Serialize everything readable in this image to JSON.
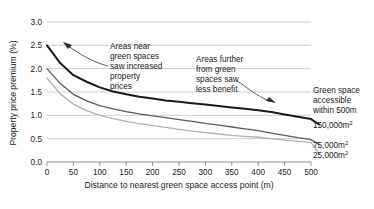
{
  "chart_data": {
    "type": "line",
    "title": "",
    "xlabel": "Distance to nearest green space access point (m)",
    "ylabel": "Property price premium (%)",
    "xlim": [
      0,
      500
    ],
    "ylim": [
      0.0,
      3.0
    ],
    "grid": true,
    "legend_position": "right",
    "x": [
      0,
      25,
      50,
      75,
      100,
      125,
      150,
      175,
      200,
      225,
      250,
      275,
      300,
      325,
      350,
      375,
      400,
      425,
      450,
      475,
      500
    ],
    "xticks": [
      "0",
      "50",
      "100",
      "150",
      "200",
      "250",
      "300",
      "350",
      "400",
      "450",
      "500"
    ],
    "xtick_values": [
      0,
      50,
      100,
      150,
      200,
      250,
      300,
      350,
      400,
      450,
      500
    ],
    "yticks": [
      "0.0",
      "0.5",
      "1.0",
      "1.5",
      "2.0",
      "2.5",
      "3.0"
    ],
    "ytick_values": [
      0.0,
      0.5,
      1.0,
      1.5,
      2.0,
      2.5,
      3.0
    ],
    "series": [
      {
        "name": "150,000m²",
        "color": "#1a1a1a",
        "width": 2.0,
        "values": [
          2.5,
          2.12,
          1.86,
          1.72,
          1.6,
          1.51,
          1.45,
          1.4,
          1.36,
          1.32,
          1.29,
          1.26,
          1.23,
          1.2,
          1.17,
          1.14,
          1.11,
          1.07,
          1.02,
          0.97,
          0.92
        ]
      },
      {
        "name": "75,000m²",
        "color": "#5b5b5b",
        "width": 1.3,
        "values": [
          2.0,
          1.68,
          1.45,
          1.31,
          1.21,
          1.14,
          1.08,
          1.03,
          0.99,
          0.95,
          0.91,
          0.87,
          0.83,
          0.79,
          0.75,
          0.71,
          0.67,
          0.62,
          0.57,
          0.52,
          0.48
        ]
      },
      {
        "name": "25,000m²",
        "color": "#b0b0b0",
        "width": 1.3,
        "values": [
          1.8,
          1.46,
          1.24,
          1.1,
          1.0,
          0.93,
          0.87,
          0.82,
          0.78,
          0.74,
          0.7,
          0.66,
          0.63,
          0.6,
          0.57,
          0.55,
          0.53,
          0.5,
          0.47,
          0.44,
          0.42
        ]
      }
    ],
    "annotations": [
      {
        "id": "near",
        "lines": [
          "Areas near",
          "green spaces",
          "saw increased",
          "property",
          "prices"
        ],
        "text": "Areas near green spaces saw increased property prices"
      },
      {
        "id": "further",
        "lines": [
          "Areas further",
          "from green",
          "spaces saw",
          "less benefit"
        ],
        "text": "Areas further from green spaces saw less benefit"
      }
    ],
    "legend_heading": {
      "lines": [
        "Green space",
        "accessible",
        "within 500m"
      ],
      "text": "Green space accessible within 500m"
    }
  }
}
